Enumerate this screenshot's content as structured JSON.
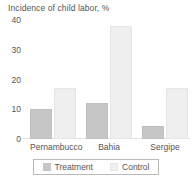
{
  "chart_data": {
    "type": "bar",
    "title": "Incidence of child labor, %",
    "xlabel": "",
    "ylabel": "",
    "ylim": [
      0,
      40
    ],
    "yticks": [
      0,
      10,
      20,
      30,
      40
    ],
    "ytick_labels": [
      "0",
      "10",
      "20",
      "30",
      "40"
    ],
    "grid": false,
    "legend_position": "bottom",
    "categories": [
      "Pernambucco",
      "Bahia",
      "Sergipe"
    ],
    "series": [
      {
        "name": "Treatment",
        "color": "#c6c6c6",
        "values": [
          10,
          12,
          4.5
        ]
      },
      {
        "name": "Control",
        "color": "#efefef",
        "values": [
          17,
          38,
          17
        ]
      }
    ]
  }
}
